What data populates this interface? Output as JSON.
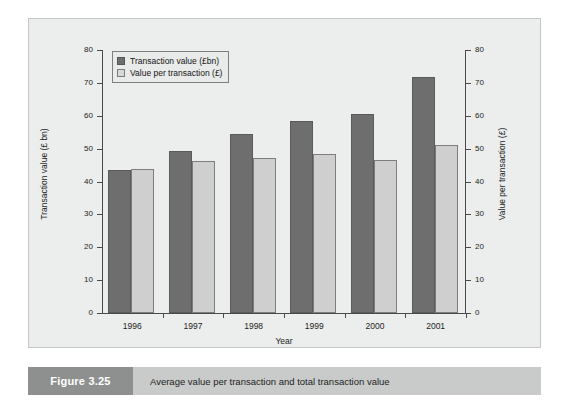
{
  "figure": {
    "number_label": "Figure 3.25",
    "caption": "Average value per transaction and total transaction value"
  },
  "colors": {
    "series_dark": "#6e6e6e",
    "series_light": "#cfcfcf",
    "panel_background": "#eceeed",
    "caption_band": "#c9cbca",
    "caption_number_block": "#8d908f",
    "axis": "#4a4a4a"
  },
  "chart_data": {
    "type": "bar",
    "title": "",
    "subtitle": "",
    "categories": [
      "1996",
      "1997",
      "1998",
      "1999",
      "2000",
      "2001"
    ],
    "series": [
      {
        "name": "Transaction value (£bn)",
        "axis": "left",
        "color": "#6e6e6e",
        "values": [
          43.5,
          49.2,
          54.3,
          58.3,
          60.5,
          71.8
        ]
      },
      {
        "name": "Value per transaction (£)",
        "axis": "right",
        "color": "#cfcfcf",
        "values": [
          43.8,
          46.2,
          47.2,
          48.5,
          46.5,
          51.0
        ]
      }
    ],
    "xlabel": "Year",
    "ylabel": "Transaction value (£ bn)",
    "y2label": "Value per transaction (£)",
    "ylim": [
      0,
      80
    ],
    "y2lim": [
      0,
      80
    ],
    "yticks": [
      0,
      10,
      20,
      30,
      40,
      50,
      60,
      70,
      80
    ],
    "y2ticks": [
      0,
      10,
      20,
      30,
      40,
      50,
      60,
      70,
      80
    ],
    "ytick_labels": [
      "0",
      "10",
      "20",
      "30",
      "40",
      "50",
      "60",
      "70",
      "80"
    ],
    "y2tick_labels": [
      "0",
      "10",
      "20",
      "30",
      "40",
      "50",
      "60",
      "70",
      "80"
    ],
    "grid": false,
    "legend_position": "top-left",
    "legend_entries": [
      "Transaction value (£bn)",
      "Value per transaction (£)"
    ]
  }
}
